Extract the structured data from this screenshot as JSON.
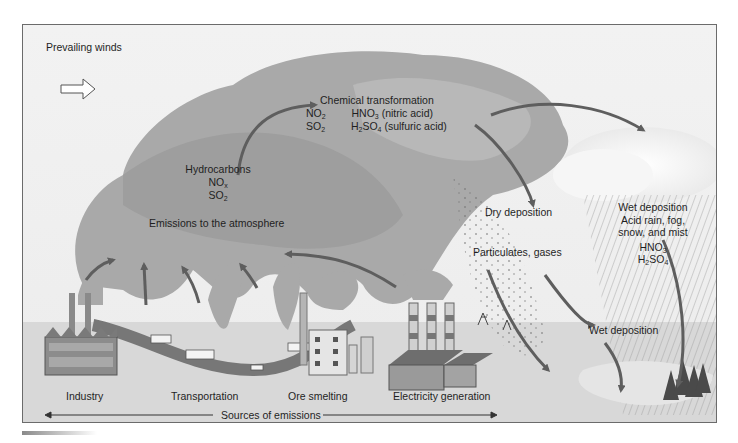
{
  "diagram": {
    "prevailing_winds": "Prevailing winds",
    "chemical_transformation": {
      "heading": "Chemical transformation",
      "rows": [
        {
          "reactant": "NO",
          "reactant_sub": "2",
          "product_pre": "HNO",
          "product_sub": "3",
          "product_post": " (nitric acid)"
        },
        {
          "reactant": "SO",
          "reactant_sub": "2",
          "product_pre": "H",
          "product_sub": "2",
          "product_mid": "SO",
          "product_sub2": "4",
          "product_post": " (sulfuric acid)"
        }
      ]
    },
    "emitted_gases": {
      "line1": "Hydrocarbons",
      "line2": "NO",
      "line2_sub": "x",
      "line3": "SO",
      "line3_sub": "2"
    },
    "emissions_label": "Emissions to the atmosphere",
    "dry_deposition": "Dry deposition",
    "particulates": "Particulates, gases",
    "wet_deposition_box": {
      "line1": "Wet deposition",
      "line2": "Acid rain, fog,",
      "line3": "snow, and mist",
      "acid1": "HNO",
      "acid1_sub": "3",
      "acid2_pre": "H",
      "acid2_sub": "2",
      "acid2_mid": "SO",
      "acid2_sub2": "4"
    },
    "wet_deposition_ground": "Wet deposition",
    "sources": [
      {
        "label": "Industry"
      },
      {
        "label": "Transportation"
      },
      {
        "label": "Ore smelting"
      },
      {
        "label": "Electricity generation"
      }
    ],
    "sources_caption": "Sources of emissions",
    "colors": {
      "sky": "#efefef",
      "smoke": "#a8a8a8",
      "smoke_dark": "#9a9a9a",
      "arrow": "#5e5e5e",
      "ground": "#d9d9d9",
      "building": "#8e8e8e",
      "cloud": "#fafafa"
    }
  }
}
